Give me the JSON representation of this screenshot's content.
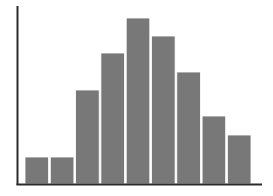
{
  "chart_data": {
    "type": "bar",
    "title": "",
    "subtitle": "",
    "xlabel": "",
    "ylabel": "",
    "categories": [
      "1",
      "2",
      "3",
      "4",
      "5",
      "6",
      "7",
      "8",
      "9"
    ],
    "values": [
      27,
      27,
      94,
      131,
      166,
      148,
      112,
      68,
      49
    ],
    "ylim": [
      0,
      178
    ],
    "xlim": [
      0,
      9
    ],
    "grid": false,
    "legend": null,
    "tick_labels_x": [],
    "tick_labels_y": [],
    "annotations": [],
    "bar_color": "#787878",
    "bar_edge_color": "#ffffff",
    "axis_color": "#2b2b2b",
    "background_color": "#ffffff"
  },
  "figure": {
    "width": 273,
    "height": 196,
    "plot_left": 17,
    "plot_right": 262,
    "plot_top": 6,
    "plot_bottom": 184,
    "bar_start_x": 25,
    "bar_pitch": 25.3,
    "bar_width": 23.6,
    "axis_line_width": 2
  }
}
